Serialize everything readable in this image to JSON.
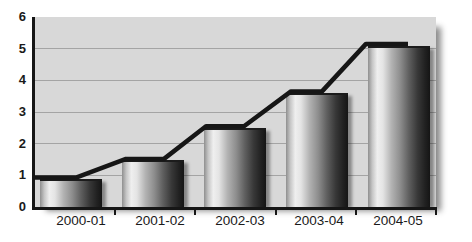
{
  "chart_data": {
    "type": "bar",
    "title": "",
    "xlabel": "",
    "ylabel": "",
    "categories": [
      "2000-01",
      "2001-02",
      "2002-03",
      "2003-04",
      "2004-05"
    ],
    "series": [
      {
        "name": "bars",
        "type": "bar",
        "values": [
          0.9,
          1.5,
          2.5,
          3.6,
          5.1
        ]
      },
      {
        "name": "trend-line",
        "type": "line",
        "values": [
          0.93,
          1.52,
          2.55,
          3.65,
          5.15
        ]
      }
    ],
    "ylim": [
      0,
      6
    ],
    "yticks": [
      0,
      1,
      2,
      3,
      4,
      5,
      6
    ],
    "grid": true,
    "legend": false,
    "line_path_px": [
      [
        -2,
        0.93
      ],
      [
        41,
        0.93
      ],
      [
        91,
        1.52
      ],
      [
        129,
        1.52
      ],
      [
        171,
        2.55
      ],
      [
        209,
        2.55
      ],
      [
        256,
        3.65
      ],
      [
        287,
        3.65
      ],
      [
        331,
        5.15
      ],
      [
        373,
        5.15
      ]
    ]
  },
  "colors": {
    "page_bg": "#ffffff",
    "plot_bg": "#d8d8d8",
    "gridline": "#a4a4a4",
    "axis": "#161616",
    "trend_line": "#161616",
    "label": "#1a1a1a",
    "plot_shadow": "rgba(0,0,0,0.45)",
    "bar_top_edge": "#1c1c1c",
    "bar_gradient_stops": [
      [
        0,
        "#8f8f8f"
      ],
      [
        7,
        "#c6c6c6"
      ],
      [
        15,
        "#efefef"
      ],
      [
        24,
        "#e4e4e4"
      ],
      [
        38,
        "#b2b2b2"
      ],
      [
        52,
        "#8d8d8d"
      ],
      [
        66,
        "#5f5f5f"
      ],
      [
        80,
        "#383838"
      ],
      [
        92,
        "#212121"
      ],
      [
        100,
        "#151515"
      ]
    ]
  }
}
